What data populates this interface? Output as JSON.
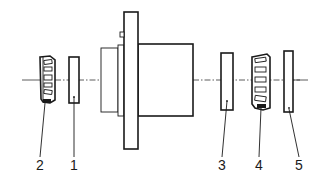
{
  "diagram": {
    "type": "exploded-view",
    "line_color": "#1a1a1a",
    "background": "#ffffff",
    "centerline": {
      "style": "dash-dot",
      "y": 80
    },
    "parts": [
      {
        "id": "2",
        "label": "2",
        "kind": "tapered roller bearing",
        "label_pos": {
          "x": 40,
          "y": 158
        }
      },
      {
        "id": "1",
        "label": "1",
        "kind": "shim / spacer ring",
        "label_pos": {
          "x": 74,
          "y": 158
        }
      },
      {
        "id": "housing",
        "label": "",
        "kind": "flanged hub / housing"
      },
      {
        "id": "3",
        "label": "3",
        "kind": "shim / spacer ring",
        "label_pos": {
          "x": 222,
          "y": 158
        }
      },
      {
        "id": "4",
        "label": "4",
        "kind": "tapered roller bearing",
        "label_pos": {
          "x": 259,
          "y": 158
        }
      },
      {
        "id": "5",
        "label": "5",
        "kind": "shim / spacer ring",
        "label_pos": {
          "x": 299,
          "y": 158
        }
      }
    ]
  }
}
